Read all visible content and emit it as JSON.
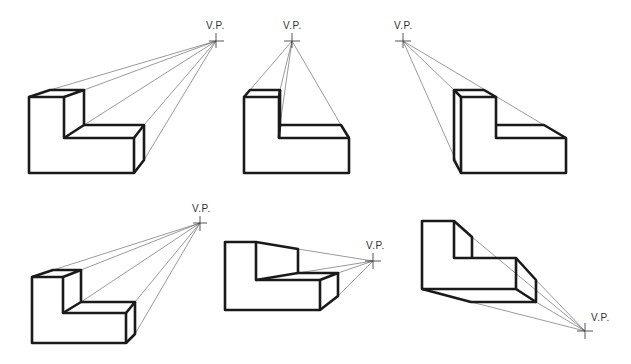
{
  "figures": [
    {
      "id": "fig-1",
      "vp_label": "V.P.",
      "vp": [
        216,
        41
      ]
    },
    {
      "id": "fig-2",
      "vp_label": "V.P.",
      "vp": [
        292,
        41
      ]
    },
    {
      "id": "fig-3",
      "vp_label": "V.P.",
      "vp": [
        403,
        41
      ]
    },
    {
      "id": "fig-4",
      "vp_label": "V.P.",
      "vp": [
        200,
        223
      ]
    },
    {
      "id": "fig-5",
      "vp_label": "V.P.",
      "vp": [
        373,
        261
      ]
    },
    {
      "id": "fig-6",
      "vp_label": "V.P.",
      "vp": [
        585,
        331
      ]
    }
  ]
}
